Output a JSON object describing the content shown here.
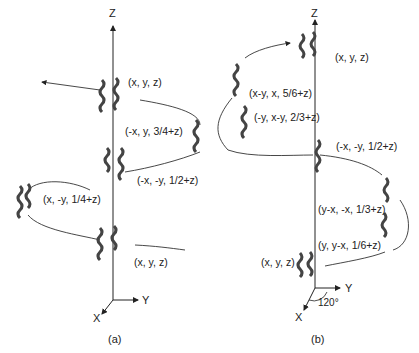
{
  "panel_a": {
    "caption": "(a)",
    "axes": {
      "z": "Z",
      "y": "Y",
      "x": "X"
    },
    "labels": [
      "(x, y, z)",
      "(-x, y, 3/4+z)",
      "(-x, -y, 1/2+z)",
      "(x, -y, 1/4+z)",
      "(x, y, z)"
    ]
  },
  "panel_b": {
    "caption": "(b)",
    "axes": {
      "z": "Z",
      "y": "Y",
      "x": "X"
    },
    "angle": "120°",
    "labels": [
      "(x, y, z)",
      "(x-y, x, 5/6+z)",
      "(-y, x-y, 2/3+z)",
      "(-x, -y, 1/2+z)",
      "(y-x, -x, 1/3+z)",
      "(y, y-x, 1/6+z)",
      "(x, y, z)"
    ]
  }
}
